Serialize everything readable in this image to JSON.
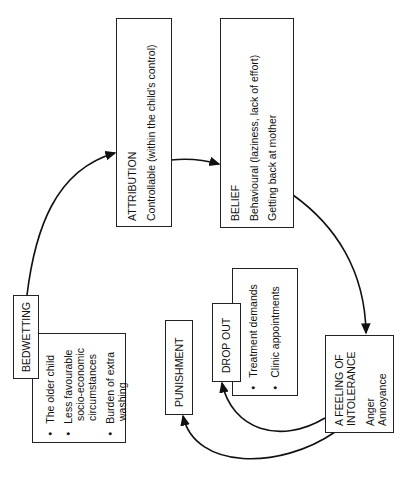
{
  "diagram": {
    "orientation": "rotated -90deg (landscape figure on portrait page)",
    "nodes": {
      "bedwetting": {
        "label": "BEDWETTING",
        "items": [
          {
            "lines": [
              "The older child"
            ]
          },
          {
            "lines": [
              "Less favourable",
              "socio-economic",
              "circumstances"
            ]
          },
          {
            "lines": [
              "Burden of extra",
              "washing"
            ]
          }
        ]
      },
      "attribution": {
        "title": "ATTRIBUTION",
        "lines": [
          "Controllable (within the child's control)"
        ]
      },
      "belief": {
        "title": "BELIEF",
        "lines": [
          "Behavioural (laziness, lack of effort)",
          "Getting back at mother"
        ]
      },
      "intolerance": {
        "title_lines": [
          "A FEELING OF",
          "INTOLERANCE"
        ],
        "lines": [
          "Anger",
          "Annoyance"
        ]
      },
      "drop_out": {
        "label": "DROP OUT",
        "items": [
          {
            "lines": [
              "Treatment demands"
            ]
          },
          {
            "lines": [
              "Clinic appointments"
            ]
          }
        ]
      },
      "punishment": {
        "label": "PUNISHMENT"
      }
    },
    "edges": [
      {
        "from": "bedwetting",
        "to": "attribution"
      },
      {
        "from": "attribution",
        "to": "belief"
      },
      {
        "from": "belief",
        "to": "intolerance"
      },
      {
        "from": "intolerance",
        "to": "drop_out"
      },
      {
        "from": "intolerance",
        "to": "punishment"
      }
    ],
    "colors": {
      "line": "#111111",
      "background": "#ffffff"
    }
  }
}
